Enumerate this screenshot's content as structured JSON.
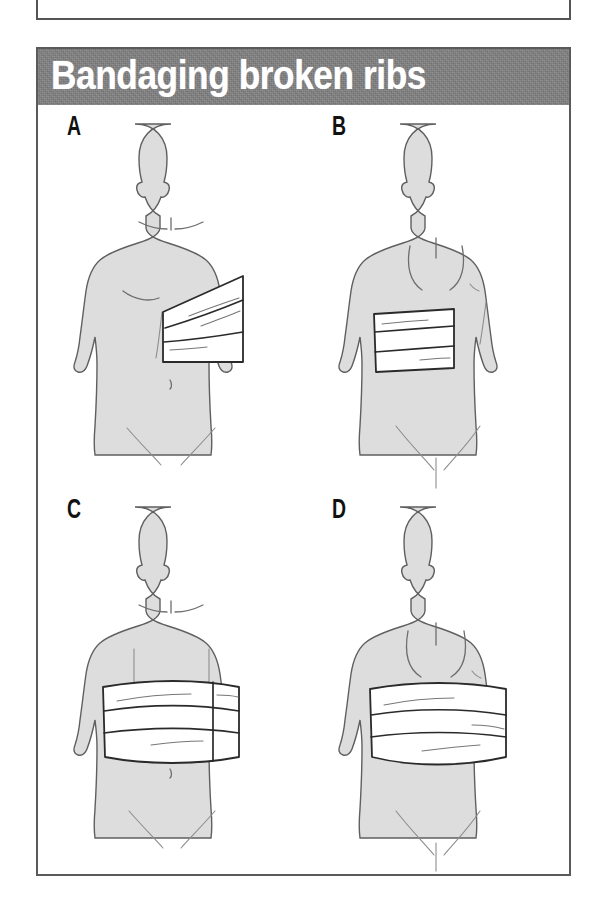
{
  "preceding_figure": {
    "clipped_caption": "bandaging broken ribs"
  },
  "figure": {
    "title": "Bandaging broken ribs",
    "banner_color": "#818181",
    "title_color": "#ffffff",
    "border_color": "#5a5a5a",
    "skin_fill": "#dddddd",
    "skin_outline": "#5f5f5f",
    "bandage_fill": "#ffffff",
    "bandage_outline": "#2a2a2a",
    "panels": [
      {
        "letter": "A",
        "view": "front",
        "description": "Front view of torso with a narrow bandage wrapped diagonally over the lower right chest"
      },
      {
        "letter": "B",
        "view": "back",
        "description": "Back view of torso with a narrow bandage wrapped horizontally over the lower left back"
      },
      {
        "letter": "C",
        "view": "front",
        "description": "Front view of torso with a wide bandage wrapped fully around the chest, vertical seam on the right side"
      },
      {
        "letter": "D",
        "view": "back",
        "description": "Back view of torso with a wide bandage wrapped fully around the chest and upper abdomen"
      }
    ]
  }
}
